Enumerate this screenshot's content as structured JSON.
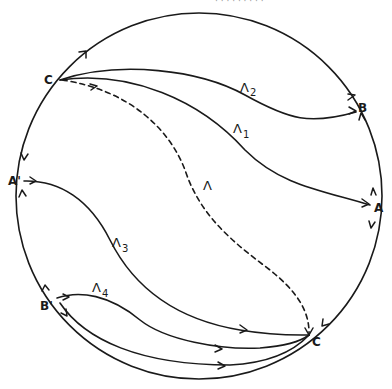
{
  "diagram": {
    "top_fragment": "· · · ·   · ·   ·  ·  ·",
    "points": {
      "C_top": "C",
      "B": "B",
      "A": "A",
      "A_prime": "A'",
      "B_prime": "B'",
      "C_bottom": "C"
    },
    "curves": {
      "lambda": {
        "symbol": "Λ",
        "subscript": "",
        "style": "dashed"
      },
      "lambda1": {
        "symbol": "Λ",
        "subscript": "1",
        "style": "solid"
      },
      "lambda2": {
        "symbol": "Λ",
        "subscript": "2",
        "style": "solid"
      },
      "lambda3": {
        "symbol": "Λ",
        "subscript": "3",
        "style": "solid"
      },
      "lambda4": {
        "symbol": "Λ",
        "subscript": "4",
        "style": "solid"
      }
    },
    "colors": {
      "ink": "#1a1a1a",
      "background": "#ffffff"
    }
  }
}
